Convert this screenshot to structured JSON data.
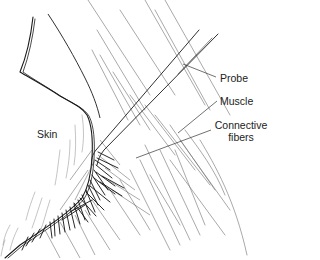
{
  "diagram": {
    "colors": {
      "ink": "#1a1a1a",
      "muscle_line": "#6e6e6e",
      "label_text": "#222222",
      "background": "#ffffff"
    },
    "labels": {
      "probe": "Probe",
      "muscle": "Muscle",
      "connective_line1": "Connective",
      "connective_line2": "fibers",
      "skin": "Skin"
    }
  }
}
